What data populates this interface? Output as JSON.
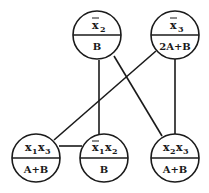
{
  "diagram": {
    "colors": {
      "stroke": "#1a1a1a",
      "background": "#ffffff"
    },
    "nodes": [
      {
        "id": "n1",
        "var": "x",
        "sub": "2",
        "bar": true,
        "label_text": "x̄2",
        "weight": "B",
        "cx": 97,
        "cy": 35
      },
      {
        "id": "n2",
        "var": "x",
        "sub": "3",
        "bar": true,
        "label_text": "x̄3",
        "weight": "2A+B",
        "cx": 175,
        "cy": 35
      },
      {
        "id": "n3",
        "label_text": "x1x3",
        "weight": "A+B",
        "cx": 36,
        "cy": 158
      },
      {
        "id": "n4",
        "label_text": "x̄1x2",
        "weight": "B",
        "cx": 104,
        "cy": 158
      },
      {
        "id": "n5",
        "label_text": "x2x3",
        "weight": "A+B",
        "cx": 175,
        "cy": 158
      }
    ],
    "edges": [
      {
        "from": "x̄2",
        "to": "x̄1x2"
      },
      {
        "from": "x̄2",
        "to": "x2x3"
      },
      {
        "from": "x̄3",
        "to": "x1x3"
      },
      {
        "from": "x̄3",
        "to": "x2x3"
      },
      {
        "from": "x1x3",
        "to": "x̄1x2"
      }
    ],
    "labels": {
      "n1_main": "x",
      "n1_sub": "2",
      "n1_weight": "B",
      "n2_main": "x",
      "n2_sub": "3",
      "n2_weight": "2A+B",
      "n3_main1": "x",
      "n3_sub1": "1",
      "n3_main2": "x",
      "n3_sub2": "3",
      "n3_weight": "A+B",
      "n4_main1": "x",
      "n4_sub1": "1",
      "n4_main2": "x",
      "n4_sub2": "2",
      "n4_weight": "B",
      "n5_main1": "x",
      "n5_sub1": "2",
      "n5_main2": "x",
      "n5_sub2": "3",
      "n5_weight": "A+B"
    }
  }
}
